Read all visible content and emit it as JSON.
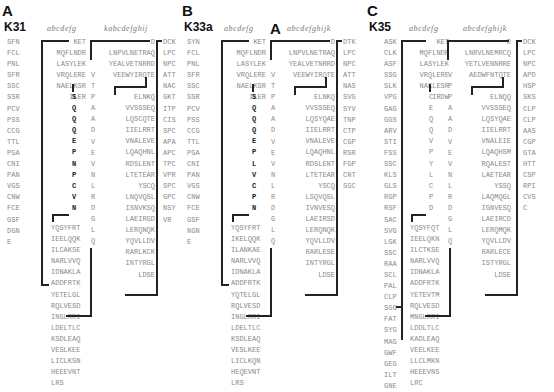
{
  "panels": [
    {
      "label": "A",
      "name": "K31",
      "heptad_left": "abcdefg",
      "heptad_right": "kabcdefghij",
      "col1": [
        "SFN",
        "FCL",
        "PNL",
        "SFR",
        "SSC",
        "SSR",
        "PCV",
        "PSS",
        "CCG",
        "TTL",
        "PGA",
        "CNI",
        "PAN",
        "VGS",
        "CNW",
        "FCE",
        "GSF",
        "DGN",
        "E"
      ],
      "col2_top": [
        "KET",
        "MQFLNDR",
        "LASYLEK",
        "VRQLERE",
        "NAELKSR",
        "ILER"
      ],
      "col2_loop": [
        "S",
        "Q",
        "Q",
        "Q",
        "E",
        "P",
        "N",
        "P",
        "C",
        "V",
        "N"
      ],
      "col2_bottom": [
        "YQSYFRT",
        "IEELQQK",
        "ILCAKSE",
        "NARLVVQ",
        "IDNAKLA",
        "ADDFRTK",
        "YETELGL",
        "RQLVESD",
        "INGLRRI",
        "LDELTLC",
        "KSDLEAQ",
        "VESLKEE",
        "LICLKSN",
        "HEEEVNT",
        "LRS"
      ],
      "col2_bottom_bold": [
        "YQSYFR",
        "",
        "",
        "",
        "",
        "",
        "",
        "",
        "",
        "",
        "SDLEAQ",
        "VESLKEE",
        "LICLK",
        "",
        ""
      ],
      "vcol": [
        "V",
        "T",
        "P",
        "A",
        "A",
        "D",
        "V",
        "E",
        "V",
        "N",
        "L",
        "R",
        "D",
        "G",
        "L",
        "Q"
      ],
      "col3_top": [
        "D",
        "LNPVLNETRAQ",
        "YEALVETNRRD",
        "VEEWYIRQTE"
      ],
      "col3_bottom": [
        "ELNKQ",
        "VVSSSEQ",
        "LQSCQTE",
        "IIELRRT",
        "VNALEVE",
        "LQAQHNL",
        "RDSLENT",
        "LTETEAR",
        "YSCQ",
        "LNQVQSL",
        "ISNVKSQ",
        "LAEIRGD",
        "LERQNQK",
        "YQVLLDV",
        "RARLKCK",
        "INTYRGL",
        "LDSE"
      ],
      "col4": [
        "DCK",
        "LPC",
        "NPC",
        "ATT",
        "NAC",
        "GKT",
        "ITP",
        "CIS",
        "SPC",
        "APA",
        "APC",
        "TPC",
        "VPR",
        "SPC",
        "GPC",
        "NSY",
        "VR"
      ]
    },
    {
      "label": "B",
      "name": "K33a",
      "heptad_left": "abcdefg",
      "bigA": "A",
      "heptad_right": "abcdefghijk",
      "col1": [
        "SYN",
        "FCL",
        "PNL",
        "SFR",
        "SSC",
        "SSR",
        "PCV",
        "PSS",
        "CCG",
        "TTL",
        "PGA",
        "CNI",
        "PAN",
        "VGS",
        "CNW",
        "FCE",
        "GSF",
        "NGN",
        "E"
      ],
      "col2_top": [
        "KET",
        "MQFLNDR",
        "LASYLEK",
        "VRQLERE",
        "NAELKSR",
        "ILER"
      ],
      "col2_loop": [
        "S",
        "Q",
        "Q",
        "Q",
        "E",
        "P",
        "L",
        "V",
        "C",
        "P",
        "N"
      ],
      "col2_bottom": [
        "YQSYFRT",
        "IKELQQK",
        "ILANKAE",
        "NARLVVQ",
        "IDNAKLA",
        "ADDFRTK",
        "YQTELGL",
        "RQLVESD",
        "INGLRRI",
        "LDELTLC",
        "KSDLEAQ",
        "VESLKEE",
        "LICLKQN",
        "HEQEVNT",
        "LRS"
      ],
      "vcol": [
        "V",
        "T",
        "P",
        "A",
        "A",
        "D",
        "V",
        "E",
        "V",
        "N",
        "L",
        "R",
        "D",
        "G",
        "L",
        "Q"
      ],
      "col3_top": [
        "D",
        "LNPVLNETRAQ",
        "YEALVETNRRD",
        "VEEWYIRQTE"
      ],
      "col3_bottom": [
        "ELNKQ",
        "VVSSSEQ",
        "LQSYQAE",
        "IIELRRT",
        "VNALEVE",
        "LQAQHNL",
        "RDSLENT",
        "LTETEAR",
        "YSCQ",
        "LSQVQSL",
        "IVNVESQ",
        "LAEIRSD",
        "LERQNQK",
        "YQVLLDV",
        "RARLESE",
        "INTYRGL",
        "LDSE"
      ],
      "col4": [
        "DTK",
        "LPC",
        "NPC",
        "ATT",
        "NAS",
        "SVG",
        "SYV",
        "TNP",
        "CTP",
        "CGP",
        "RSR",
        "FGP",
        "CNT",
        "SGC"
      ]
    },
    {
      "label": "C",
      "name": "K35",
      "heptad_left": "abcdefg",
      "heptad_right": "abcdefghijk",
      "col1": [
        "ASK",
        "CLK",
        "ASF",
        "SSG",
        "SLK",
        "VPG",
        "GAG",
        "GGS",
        "ARV",
        "STI",
        "FSS",
        "SSC",
        "KLS",
        "GLS",
        "RGP",
        "RSF",
        "SAC",
        "SVG",
        "LGK",
        "SSC",
        "RAA",
        "SCL",
        "PAL",
        "CLP",
        "SGG",
        "FAT",
        "SYG",
        "MAG",
        "GWF",
        "GEG",
        "ILT",
        "GNE"
      ],
      "col2_top": [
        "KET",
        "MQFLNDR",
        "LASYLEK",
        "VRQLERE",
        "NAKLESR",
        "IRDW"
      ],
      "col2_loop": [
        "C",
        "E",
        "Q",
        "Q",
        "V",
        "P",
        "Y",
        "L",
        "C",
        "P",
        "D"
      ],
      "col2_bottom": [
        "YQSYFQT",
        "IEELQKN",
        "ILCTKSE",
        "NARLVVQ",
        "IDNAKLA",
        "ADDFRTK",
        "YETEVTM",
        "RQLVESD",
        "MNGLRRI",
        "LDDLTLC",
        "KADLEAQ",
        "VEELKEE",
        "LLCLMKN",
        "HEEEVNS",
        "LRC"
      ],
      "vcol": [
        "V",
        "P",
        "P",
        "A",
        "A",
        "D",
        "V",
        "E",
        "V",
        "N",
        "L",
        "R",
        "D",
        "G",
        "L",
        "Q"
      ],
      "col3_top": [
        "D",
        "LNRVLNEMRCQ",
        "YETLVENNRRE",
        "AEDWFNTQTE"
      ],
      "col3_bottom": [
        "ELNQQ",
        "VVSSSEQ",
        "LQSYQAE",
        "IIELRRT",
        "VNALEIE",
        "LQAQHSM",
        "RQALEST",
        "LAETEAR",
        "YSSQ",
        "LAQMQGL",
        "IGNVESQ",
        "LAEIRCD",
        "LERQMQK",
        "YQVLLDV",
        "RARLECE",
        "ISTYRGL",
        "LDSE"
      ],
      "col4": [
        "DCK",
        "LPC",
        "NPC",
        "APD",
        "HSP",
        "SKS",
        "CLP",
        "CLP",
        "AAS",
        "CGP",
        "GTA",
        "HTT",
        "CSP",
        "RPI",
        "CVS",
        "C"
      ]
    }
  ]
}
